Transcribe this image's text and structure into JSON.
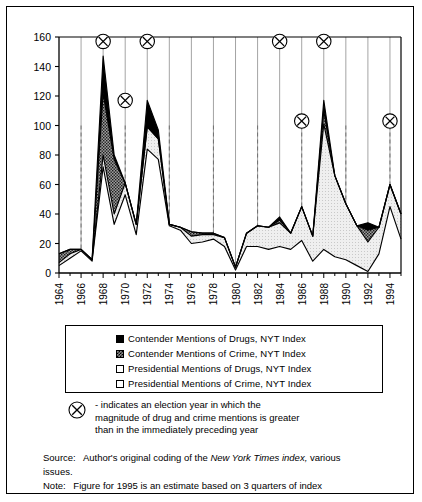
{
  "chart_data": {
    "type": "area",
    "stacked": true,
    "title": "",
    "xlabel": "",
    "ylabel": "",
    "ylim": [
      0,
      160
    ],
    "ytick_step": 20,
    "yticks": [
      0,
      20,
      40,
      60,
      80,
      100,
      120,
      140,
      160
    ],
    "xlim": [
      1964,
      1995
    ],
    "xticks": [
      1964,
      1966,
      1968,
      1970,
      1972,
      1974,
      1976,
      1978,
      1980,
      1982,
      1984,
      1986,
      1988,
      1990,
      1992,
      1994
    ],
    "xticklabels": [
      "1964",
      "1966",
      "1968",
      "1970",
      "1972",
      "1974",
      "1976",
      "1978",
      "1980",
      "1982",
      "1984",
      "1986",
      "1988",
      "1990",
      "1992",
      "1994"
    ],
    "x": [
      1964,
      1965,
      1966,
      1967,
      1968,
      1969,
      1970,
      1971,
      1972,
      1973,
      1974,
      1975,
      1976,
      1977,
      1978,
      1979,
      1980,
      1981,
      1982,
      1983,
      1984,
      1985,
      1986,
      1987,
      1988,
      1989,
      1990,
      1991,
      1992,
      1993,
      1994,
      1995
    ],
    "grid": "vertical-year-lines",
    "legend_position": "below-plot",
    "series": [
      {
        "name": "Presidential Mentions of Crime, NYT Index",
        "key": "pres_crime",
        "fill": "#ffffff",
        "values": [
          5,
          10,
          15,
          8,
          72,
          33,
          53,
          26,
          84,
          77,
          32,
          29,
          20,
          21,
          23,
          18,
          2,
          18,
          18,
          16,
          18,
          16,
          22,
          8,
          16,
          11,
          9,
          5,
          1,
          13,
          45,
          23
        ]
      },
      {
        "name": "Presidential Mentions of Drugs, NYT Index",
        "key": "pres_drugs",
        "fill": "#ffffff",
        "values": [
          7,
          13,
          16,
          9,
          80,
          40,
          61,
          33,
          99,
          91,
          33,
          31,
          25,
          26,
          26,
          24,
          4,
          27,
          32,
          31,
          34,
          27,
          45,
          25,
          101,
          66,
          47,
          32,
          21,
          31,
          60,
          40
        ]
      },
      {
        "name": "Contender Mentions of Crime, NYT Index",
        "key": "cont_crime",
        "fill": "#9a9a9a",
        "values": [
          13,
          16,
          16,
          9,
          122,
          77,
          61,
          33,
          99,
          91,
          33,
          31,
          28,
          27,
          27,
          24,
          4,
          27,
          32,
          31,
          36,
          27,
          45,
          25,
          110,
          66,
          47,
          32,
          29,
          31,
          60,
          40
        ]
      },
      {
        "name": "Contender Mentions of Drugs, NYT Index",
        "key": "cont_drugs",
        "fill": "#000000",
        "values": [
          13,
          16,
          16,
          9,
          147,
          80,
          61,
          33,
          117,
          97,
          33,
          31,
          28,
          27,
          27,
          24,
          4,
          27,
          32,
          31,
          38,
          27,
          45,
          25,
          117,
          66,
          47,
          32,
          34,
          31,
          60,
          40
        ]
      }
    ],
    "markers": {
      "symbol": "circled-x",
      "meaning": "election year in which the magnitude of drug and crime mentions is greater than in the immediately preceding year",
      "points": [
        {
          "year": 1968,
          "y": 157
        },
        {
          "year": 1970,
          "y": 117
        },
        {
          "year": 1972,
          "y": 157
        },
        {
          "year": 1984,
          "y": 157
        },
        {
          "year": 1986,
          "y": 103
        },
        {
          "year": 1988,
          "y": 157
        },
        {
          "year": 1994,
          "y": 103
        }
      ]
    }
  },
  "legend": {
    "items": [
      {
        "swatch": "black",
        "label": "Contender Mentions of Drugs, NYT Index"
      },
      {
        "swatch": "dark",
        "label": "Contender Mentions of Crime, NYT Index"
      },
      {
        "swatch": "white",
        "label": "Presidential Mentions of Drugs, NYT Index"
      },
      {
        "swatch": "white",
        "label": "Presidential Mentions of Crime, NYT Index"
      }
    ]
  },
  "marker_note": {
    "line1": "- indicates an election year in which the",
    "line2": "magnitude of drug and crime mentions is greater",
    "line3": "than in the immediately preceding year"
  },
  "footer": {
    "source_prefix": "Source:",
    "source_text_a": "Author's original coding of the",
    "source_italic": "New York Times index,",
    "source_text_b": "various",
    "source_line2": "issues.",
    "note_prefix": "Note:",
    "note_text": "Figure for 1995 is an estimate based on 3 quarters of index"
  }
}
